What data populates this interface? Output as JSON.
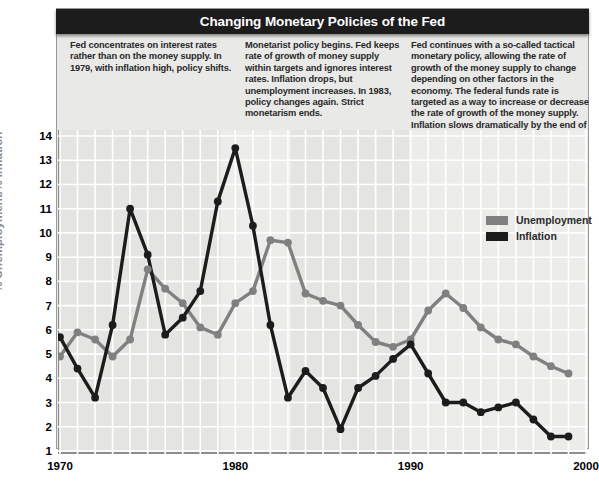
{
  "title": "Changing Monetary Policies of the Fed",
  "colors": {
    "unemployment": "#808080",
    "inflation": "#1c1c1c",
    "title_bar": "#1c1c1c",
    "plot_bg": "#e4e4e2",
    "panel_bg": "#e9e9e7",
    "grid": "#ffffff",
    "axis": "#8d8d8b",
    "axis_title": "#8a8a88"
  },
  "annotations": [
    {
      "id": "policy-era-1",
      "text": "Fed concentrates on interest rates rather than on the money supply. In 1979, with inflation high, policy shifts."
    },
    {
      "id": "policy-era-2",
      "text": "Monetarist policy begins. Fed keeps rate of growth of money supply within targets and ignores interest rates. Inflation drops, but unemployment increases. In 1983, policy changes again. Strict monetarism ends."
    },
    {
      "id": "policy-era-3",
      "text": "Fed continues with a so-called tactical monetary policy, allowing the rate of growth of the money supply to change depending on other factors in the economy. The federal funds rate is targeted as a way to increase or decrease the rate of growth of the money supply. Inflation slows dramatically by the end of the century."
    }
  ],
  "legend": {
    "position": "inside-top-right",
    "entries": [
      {
        "label": "Unemployment",
        "color": "#808080"
      },
      {
        "label": "Inflation",
        "color": "#1c1c1c"
      }
    ]
  },
  "chart_data": {
    "type": "line",
    "title": "Changing Monetary Policies of the Fed",
    "xlabel": "",
    "ylabel": "% Unemployment/% Inflation",
    "xlim": [
      1970,
      2000
    ],
    "ylim": [
      1,
      14
    ],
    "xticks": [
      1970,
      1980,
      1990,
      2000
    ],
    "ytick_labels": [
      14,
      13,
      12,
      11,
      10,
      9,
      8,
      7,
      6,
      5,
      4,
      3,
      2,
      1
    ],
    "grid": true,
    "legend_position": "inside-top-right",
    "x": [
      1970,
      1971,
      1972,
      1973,
      1974,
      1975,
      1976,
      1977,
      1978,
      1979,
      1980,
      1981,
      1982,
      1983,
      1984,
      1985,
      1986,
      1987,
      1988,
      1989,
      1990,
      1991,
      1992,
      1993,
      1994,
      1995,
      1996,
      1997,
      1998,
      1999
    ],
    "series": [
      {
        "name": "Unemployment",
        "color": "#808080",
        "values": [
          4.9,
          5.9,
          5.6,
          4.9,
          5.6,
          8.5,
          7.7,
          7.1,
          6.1,
          5.8,
          7.1,
          7.6,
          9.7,
          9.6,
          7.5,
          7.2,
          7.0,
          6.2,
          5.5,
          5.3,
          5.6,
          6.8,
          7.5,
          6.9,
          6.1,
          5.6,
          5.4,
          4.9,
          4.5,
          4.2
        ]
      },
      {
        "name": "Inflation",
        "color": "#1c1c1c",
        "values": [
          5.7,
          4.4,
          3.2,
          6.2,
          11.0,
          9.1,
          5.8,
          6.5,
          7.6,
          11.3,
          13.5,
          10.3,
          6.2,
          3.2,
          4.3,
          3.6,
          1.9,
          3.6,
          4.1,
          4.8,
          5.4,
          4.2,
          3.0,
          3.0,
          2.6,
          2.8,
          3.0,
          2.3,
          1.6,
          1.6
        ]
      }
    ],
    "notable_points": [
      {
        "series": "Inflation",
        "year": 1980,
        "value": 13.5,
        "note": "peak inflation"
      },
      {
        "series": "Inflation",
        "year": 1974,
        "value": 11.0,
        "note": "first oil-shock peak"
      },
      {
        "series": "Unemployment",
        "year": 1982,
        "value": 9.7,
        "note": "peak unemployment"
      },
      {
        "series": "Unemployment",
        "year": 1975,
        "value": 8.5,
        "note": "recession peak"
      }
    ]
  }
}
